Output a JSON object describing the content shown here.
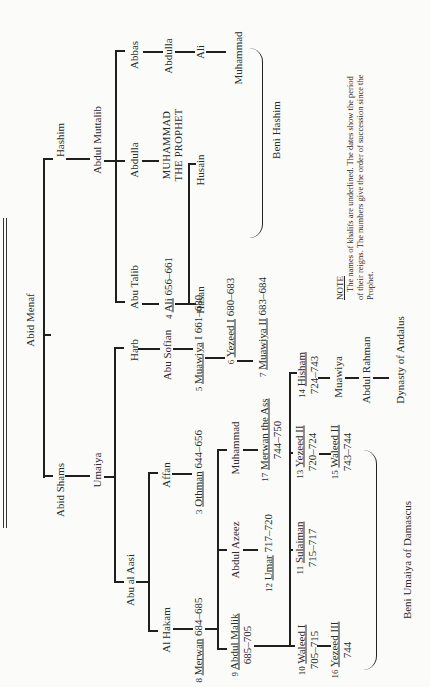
{
  "orientation": "rotated 90° counter-clockwise",
  "nodes": {
    "abid_menaf": "Abid Menaf",
    "hashim": "Hashim",
    "abid_shams": "Abid Shams",
    "umaiya": "Umaiya",
    "abdul_muttalib": "Abdul Muttalib",
    "abbas": "Abbas",
    "abdulla_abbas": "Abdulla",
    "ali_abbasid": "Ali",
    "muhammad_abbasid": "Muhammad",
    "abdulla": "Abdulla",
    "muhammad_prophet_1": "MUHAMMAD",
    "muhammad_prophet_2": "THE PROPHET",
    "abu_talib": "Abu Talib",
    "ali_num": "4",
    "ali_name": "Ali",
    "ali_dates": "656–661",
    "husain": "Husain",
    "hasan": "Hasan",
    "harb": "Harb",
    "abu_sofian": "Abu Sofian",
    "muawiya1_num": "5",
    "muawiya1_name": "Muawiya",
    "muawiya1_dates": "I 661–680",
    "yezeed1_num": "6",
    "yezeed1_name": "Yezeed I",
    "yezeed1_dates": "680–683",
    "muawiya2_num": "7",
    "muawiya2_name": "Muawiya II",
    "muawiya2_dates": "683–684",
    "abu_al_aasi": "Abu al Aasi",
    "affan": "Affan",
    "othman_num": "3",
    "othman_name": "Othman",
    "othman_dates": "644–656",
    "al_hakam": "Al Hakam",
    "merwan_num": "8",
    "merwan_name": "Merwan",
    "merwan_dates": "684–685",
    "abdul_malik_num": "9",
    "abdul_malik_name": "Abdul Malik",
    "abdul_malik_dates": "685–705",
    "abdul_azeez": "Abdul Azeez",
    "umar_num": "12",
    "umar_name": "Umar",
    "umar_dates": "717–720",
    "muhammad_umaiyad": "Muhammad",
    "merwan2_num": "17",
    "merwan2_name": "Merwan the Ass",
    "merwan2_dates": "744–750",
    "waleed1_num": "10",
    "waleed1_name": "Waleed I",
    "waleed1_dates": "705–715",
    "sulaiman_num": "11",
    "sulaiman_name": "Sulaiman",
    "sulaiman_dates": "715–717",
    "yezeed2_num": "13",
    "yezeed2_name": "Yezeed II",
    "yezeed2_dates": "720–724",
    "hisham_num": "14",
    "hisham_name": "Hisham",
    "hisham_dates": "724–743",
    "waleed2_num": "15",
    "waleed2_name": "Waleed II",
    "waleed2_dates": "743–744",
    "yezeed3_num": "16",
    "yezeed3_name": "Yezeed III",
    "yezeed3_dates": "744",
    "muawiya_andalus": "Muawiya",
    "abdul_rahman": "Abdul Rahman"
  },
  "groups": {
    "beni_hashim": "Beni Hashim",
    "beni_umaiya": "Beni Umaiya of Damascus",
    "andalus": "Dynasty of Andalus"
  },
  "note": {
    "title": "NOTE",
    "text": "The names of khalifs are underlined. The dates show the period of their reigns. The numbers give the order of succession since the Prophet."
  }
}
